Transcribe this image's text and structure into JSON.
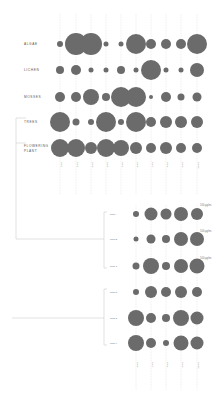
{
  "chart_data": [
    {
      "type": "scatter",
      "subtype": "bubble-matrix",
      "title": "",
      "rows": [
        "ALGAE",
        "LICHEN",
        "MOSSES",
        "TREES",
        "FLOWERING PLANT"
      ],
      "columns": [
        "Col 1",
        "Col 2",
        "Col 3",
        "Col 4",
        "Col 5",
        "Col 6",
        "Col 7",
        "Col 8",
        "Col 9",
        "Col 10"
      ],
      "column_labels_legible": false,
      "values": [
        [
          3,
          11,
          11,
          2.5,
          2.5,
          10,
          5,
          5,
          5,
          10
        ],
        [
          4,
          5,
          2.5,
          2.5,
          4,
          2.5,
          10,
          2.5,
          2.5,
          7
        ],
        [
          5,
          5,
          8,
          4,
          10,
          10,
          2,
          5,
          3.5,
          4.5
        ],
        [
          10,
          3.5,
          3,
          10,
          3,
          10,
          5,
          6,
          6,
          6
        ],
        [
          9,
          9,
          6,
          9,
          8,
          6,
          5,
          6,
          5,
          5
        ]
      ],
      "value_meaning": "relative bubble radius (px)",
      "grid": true
    },
    {
      "type": "scatter",
      "subtype": "bubble-matrix",
      "rows": [
        "Row A",
        "Row B",
        "Row C",
        "Row D",
        "Row E",
        "Row F"
      ],
      "row_labels_legible": false,
      "columns": [
        "Col 6",
        "Col 7",
        "Col 8",
        "Col 9",
        "Col 10"
      ],
      "values": [
        [
          3,
          6.5,
          5.5,
          7,
          6
        ],
        [
          2.5,
          4.5,
          4,
          7,
          7
        ],
        [
          3.5,
          8,
          4,
          7,
          7.5
        ],
        [
          3,
          6,
          5,
          6,
          5
        ],
        [
          8,
          5,
          4,
          8,
          6.5
        ],
        [
          8,
          5,
          3,
          7.5,
          6.5
        ]
      ],
      "annotations": [
        "100 µg/m³",
        "100 µg/m³",
        "100 µg/m³"
      ],
      "value_meaning": "relative bubble radius (px)",
      "grid": true
    }
  ],
  "top": {
    "row_labels": [
      "ALGAE",
      "LICHEN",
      "MOSSES",
      "TREES",
      "FLOWERING",
      "PLANT"
    ]
  },
  "bottom": {
    "units": [
      "100 µg/m³",
      "100 µg/m³",
      "100 µg/m³"
    ]
  }
}
